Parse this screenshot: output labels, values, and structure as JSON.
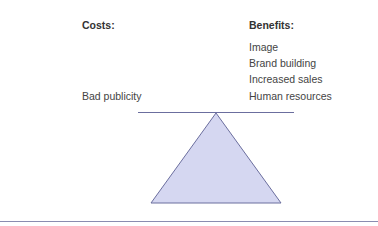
{
  "costs": {
    "heading": "Costs:",
    "items": [
      "Bad publicity"
    ]
  },
  "benefits": {
    "heading": "Benefits:",
    "items": [
      "Image",
      "Brand building",
      "Increased sales",
      "Human resources"
    ]
  },
  "colors": {
    "beam": "#6b6e9e",
    "fulcrum_fill": "#d5d7f1",
    "fulcrum_stroke": "#6b6e9e",
    "rule": "#8a8cb0"
  }
}
